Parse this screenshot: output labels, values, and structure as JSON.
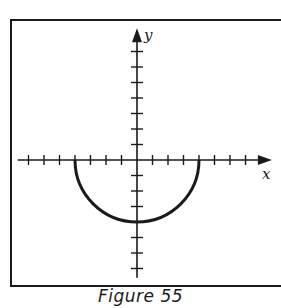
{
  "figure": {
    "caption": "Figure 55",
    "x_axis_label": "x",
    "y_axis_label": "y",
    "colors": {
      "ink": "#1a1a1a",
      "background": "#ffffff"
    }
  },
  "chart_data": {
    "type": "line",
    "title": "Figure 55",
    "equation": "y = -sqrt(16 - x^2)",
    "xlabel": "x",
    "ylabel": "y",
    "x_ticks": [
      -7,
      -6,
      -5,
      -4,
      -3,
      -2,
      -1,
      1,
      2,
      3,
      4,
      5,
      6,
      7
    ],
    "y_ticks": [
      -7,
      -6,
      -5,
      -4,
      -3,
      -2,
      -1,
      1,
      2,
      3,
      4,
      5,
      6,
      7
    ],
    "xlim": [
      -7.7,
      8.7
    ],
    "ylim": [
      -7.6,
      8.5
    ],
    "grid": false,
    "series": [
      {
        "name": "semicircle",
        "center": [
          0,
          0
        ],
        "radius": 4,
        "x": [
          -4,
          -3,
          -2,
          -1,
          0,
          1,
          2,
          3,
          4
        ],
        "y": [
          0,
          -2.65,
          -3.46,
          -3.87,
          -4,
          -3.87,
          -3.46,
          -2.65,
          0
        ]
      }
    ]
  }
}
